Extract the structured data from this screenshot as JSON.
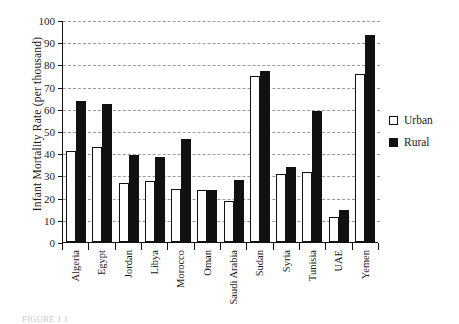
{
  "chart_data": {
    "type": "bar",
    "title": "",
    "xlabel": "",
    "ylabel": "Infant Mortality Rate (per thousand)",
    "ylim": [
      0,
      100
    ],
    "ytick_labels": [
      "100",
      "90",
      "80",
      "70",
      "60",
      "50",
      "40",
      "30",
      "20",
      "10",
      "0"
    ],
    "ytick_values": [
      100,
      90,
      80,
      70,
      60,
      50,
      40,
      30,
      20,
      10,
      0
    ],
    "grid": "horizontal-dashed",
    "legend_position": "right",
    "categories": [
      "Algeria",
      "Egypt",
      "Jordan",
      "Libya",
      "Morocco",
      "Oman",
      "Saudi Arabia",
      "Sudan",
      "Syria",
      "Tunisia",
      "UAE",
      "Yemen"
    ],
    "series": [
      {
        "name": "Urban",
        "color": "#ffffff",
        "values": [
          41,
          43,
          26.5,
          27.5,
          24,
          23.5,
          18.5,
          75,
          31,
          31.5,
          11.5,
          76
        ]
      },
      {
        "name": "Rural",
        "color": "#111111",
        "values": [
          64,
          62.5,
          39.5,
          38.5,
          46.5,
          23.5,
          28,
          77.5,
          34,
          59.5,
          14.5,
          93.5
        ]
      }
    ]
  },
  "legend": {
    "items": [
      {
        "label": "Urban"
      },
      {
        "label": "Rural"
      }
    ]
  },
  "caption": {
    "text": "FIGURE 1.1"
  }
}
